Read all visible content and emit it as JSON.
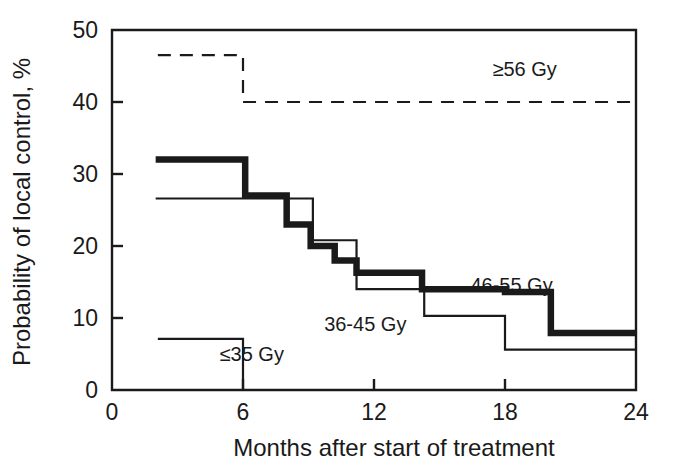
{
  "chart_data": {
    "type": "line",
    "subtype": "kaplan-meier-step",
    "title": "",
    "xlabel": "Months after start of treatment",
    "ylabel": "Probability of local control, %",
    "xlim": [
      0,
      24
    ],
    "ylim": [
      0,
      50
    ],
    "xticks": [
      0,
      6,
      12,
      18,
      24
    ],
    "xticklabels": [
      "0",
      "6",
      "12",
      "18",
      "24"
    ],
    "yticks": [
      0,
      10,
      20,
      30,
      40,
      50
    ],
    "yticklabels": [
      "0",
      "10",
      "20",
      "30",
      "40",
      "50"
    ],
    "grid": false,
    "legend_position": "inline-annotations",
    "series": [
      {
        "name": "≥56 Gy",
        "label": "≥56 Gy",
        "style": "dashed",
        "linewidth": "thin",
        "color": "#1a1a1a",
        "label_x": 18.9,
        "label_y": 43.6,
        "x": [
          2.1,
          6.0,
          6.0,
          24.0
        ],
        "y": [
          46.5,
          46.5,
          40.0,
          40.0
        ],
        "steps": [
          {
            "x_start": 2.1,
            "x_end": 6.0,
            "value": 46.5
          },
          {
            "x_start": 6.0,
            "x_end": 24.0,
            "value": 40.0
          }
        ]
      },
      {
        "name": "46-55 Gy",
        "label": "46-55 Gy",
        "style": "solid",
        "linewidth": "thick",
        "color": "#1a1a1a",
        "label_x": 18.3,
        "label_y": 13.6,
        "x": [
          2.0,
          6.1,
          6.1,
          8.0,
          8.0,
          9.1,
          9.1,
          10.2,
          10.2,
          11.2,
          11.2,
          14.2,
          14.2,
          18.0,
          18.0,
          20.1,
          20.1,
          24.0
        ],
        "y": [
          32.0,
          32.0,
          27.0,
          27.0,
          23.0,
          23.0,
          20.0,
          20.0,
          18.0,
          18.0,
          16.3,
          16.3,
          14.0,
          14.0,
          13.6,
          13.6,
          7.9,
          7.9
        ],
        "steps": [
          {
            "x_start": 2.0,
            "x_end": 6.1,
            "value": 32.0
          },
          {
            "x_start": 6.1,
            "x_end": 8.0,
            "value": 27.0
          },
          {
            "x_start": 8.0,
            "x_end": 9.1,
            "value": 23.0
          },
          {
            "x_start": 9.1,
            "x_end": 10.2,
            "value": 20.0
          },
          {
            "x_start": 10.2,
            "x_end": 11.2,
            "value": 18.0
          },
          {
            "x_start": 11.2,
            "x_end": 14.2,
            "value": 16.3
          },
          {
            "x_start": 14.2,
            "x_end": 18.0,
            "value": 14.0
          },
          {
            "x_start": 18.0,
            "x_end": 20.1,
            "value": 13.6
          },
          {
            "x_start": 20.1,
            "x_end": 24.0,
            "value": 7.9
          }
        ]
      },
      {
        "name": "36-45 Gy",
        "label": "36-45 Gy",
        "style": "solid",
        "linewidth": "thin",
        "color": "#1a1a1a",
        "label_x": 11.6,
        "label_y": 8.2,
        "x": [
          2.0,
          8.2,
          8.2,
          9.2,
          9.2,
          11.2,
          11.2,
          14.3,
          14.3,
          18.0,
          18.0,
          24.0
        ],
        "y": [
          26.6,
          26.6,
          26.6,
          26.6,
          20.8,
          20.8,
          14.0,
          14.0,
          10.3,
          10.3,
          5.6,
          5.6
        ],
        "steps": [
          {
            "x_start": 2.0,
            "x_end": 9.2,
            "value": 26.6
          },
          {
            "x_start": 9.2,
            "x_end": 11.2,
            "value": 20.8
          },
          {
            "x_start": 11.2,
            "x_end": 14.3,
            "value": 14.0
          },
          {
            "x_start": 14.3,
            "x_end": 18.0,
            "value": 10.3
          },
          {
            "x_start": 18.0,
            "x_end": 24.0,
            "value": 5.6
          }
        ]
      },
      {
        "name": "≤35 Gy",
        "label": "≤35 Gy",
        "style": "solid",
        "linewidth": "thin",
        "color": "#1a1a1a",
        "label_x": 6.4,
        "label_y": 4.0,
        "x": [
          2.1,
          6.0,
          6.0
        ],
        "y": [
          7.1,
          7.1,
          0.0
        ],
        "steps": [
          {
            "x_start": 2.1,
            "x_end": 6.0,
            "value": 7.1
          }
        ]
      }
    ]
  }
}
